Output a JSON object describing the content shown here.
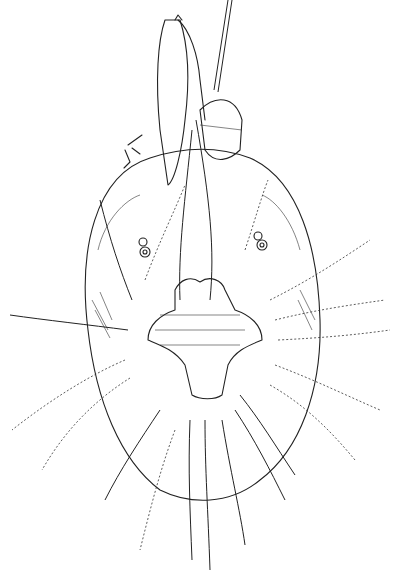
{
  "figure": {
    "style": "scientific line drawing",
    "background": "#ffffff",
    "ink": "#222222"
  }
}
